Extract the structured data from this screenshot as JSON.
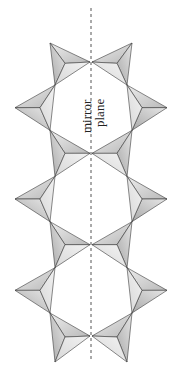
{
  "figure": {
    "label_line1": "mirror",
    "label_line2": "plane",
    "colors": {
      "background": "#ffffff",
      "face_light": "#e4e4e4",
      "face_mid": "#cfcfcf",
      "face_dark": "#b4b4b4",
      "edge": "#3a3a3a",
      "mirror_line": "#555555",
      "text": "#222222"
    },
    "mirror_plane": {
      "x": 91,
      "y_start": 8,
      "y_end": 360,
      "style": "dashed"
    },
    "chain": {
      "description": "Two chains of corner-sharing tetrahedra (viewed down apex) related by a vertical mirror plane",
      "junction_y": [
        62,
        153,
        245,
        336
      ],
      "tetrahedra_per_side": 7
    }
  }
}
